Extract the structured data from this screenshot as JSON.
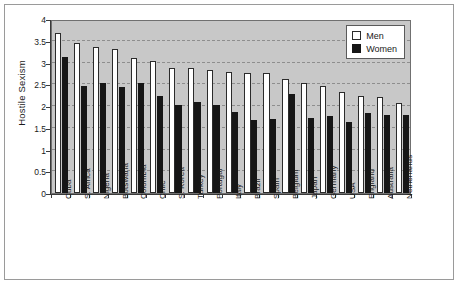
{
  "chart_data": {
    "type": "bar",
    "title": "",
    "xlabel": "",
    "ylabel": "Hostile Sexism",
    "ylim": [
      0,
      4
    ],
    "yticks": [
      "0",
      "0.5",
      "1",
      "1.5",
      "2",
      "2.5",
      "3",
      "3.5",
      "4"
    ],
    "grid": true,
    "legend_position": "top-right",
    "categories": [
      "Cuba",
      "S. Africa",
      "Nigeria",
      "Botswana",
      "Colombia",
      "Chile",
      "S. Korea",
      "Turkey",
      "Portugal",
      "Italy",
      "Brazil",
      "Spain",
      "Belgium",
      "Japan",
      "Germany",
      "USA",
      "England",
      "Australia",
      "Netherlands"
    ],
    "series": [
      {
        "name": "Men",
        "color": "#ffffff",
        "values": [
          3.67,
          3.46,
          3.36,
          3.31,
          3.1,
          3.04,
          2.88,
          2.88,
          2.83,
          2.79,
          2.76,
          2.75,
          2.61,
          2.53,
          2.46,
          2.33,
          2.22,
          2.2,
          2.07
        ],
        "legend_label": "Men"
      },
      {
        "name": "Women",
        "color": "#161616",
        "values": [
          3.12,
          2.47,
          2.52,
          2.44,
          2.52,
          2.23,
          2.03,
          2.09,
          2.03,
          1.86,
          1.68,
          1.7,
          2.28,
          1.73,
          1.76,
          1.63,
          1.83,
          1.8,
          1.8
        ],
        "legend_label": "Women"
      }
    ]
  },
  "legend": {
    "men_label": "Men",
    "women_label": "Women"
  },
  "axes": {
    "y_title": "Hostile Sexism"
  }
}
